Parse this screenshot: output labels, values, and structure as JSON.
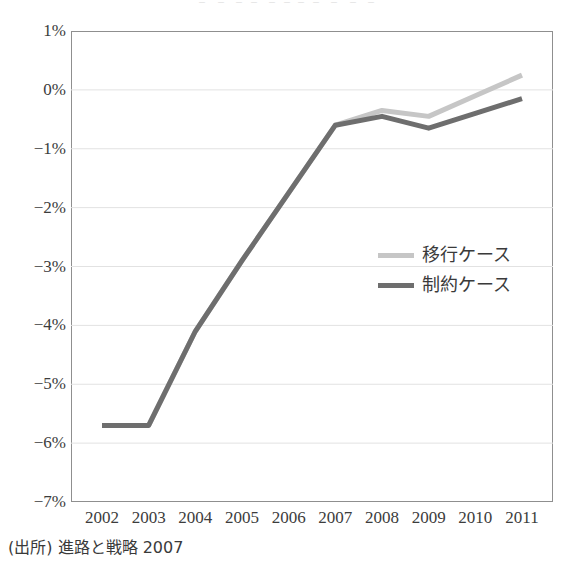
{
  "clipped_heading": "゠  ゠  ゠゠  ゠゠゠゠  ゠  ゠  ゠",
  "source_note": "(出所) 進路と戦略 2007",
  "legend": {
    "position": "inside-right",
    "entries": [
      {
        "label": "移行ケース",
        "color": "#c6c6c6"
      },
      {
        "label": "制約ケース",
        "color": "#6e6e6e"
      }
    ]
  },
  "axis": {
    "y_ticks": [
      "1%",
      "0%",
      "−1%",
      "−2%",
      "−3%",
      "−4%",
      "−5%",
      "−6%",
      "−7%"
    ],
    "x_ticks": [
      "2002",
      "2003",
      "2004",
      "2005",
      "2006",
      "2007",
      "2008",
      "2009",
      "2010",
      "2011"
    ]
  },
  "chart_data": {
    "type": "line",
    "title": "",
    "xlabel": "",
    "ylabel": "",
    "x": [
      2002,
      2003,
      2004,
      2005,
      2006,
      2007,
      2008,
      2009,
      2010,
      2011
    ],
    "categories": [
      "2002",
      "2003",
      "2004",
      "2005",
      "2006",
      "2007",
      "2008",
      "2009",
      "2010",
      "2011"
    ],
    "series": [
      {
        "name": "移行ケース",
        "color": "#c6c6c6",
        "values": [
          -5.7,
          -5.7,
          -4.1,
          -2.9,
          -1.75,
          -0.6,
          -0.35,
          -0.45,
          -0.1,
          0.25
        ]
      },
      {
        "name": "制約ケース",
        "color": "#6e6e6e",
        "values": [
          -5.7,
          -5.7,
          -4.1,
          -2.9,
          -1.75,
          -0.6,
          -0.45,
          -0.65,
          -0.4,
          -0.15
        ]
      }
    ],
    "ylim": [
      -7,
      1
    ],
    "xlim": [
      2002,
      2011
    ],
    "ytick_values": [
      1,
      0,
      -1,
      -2,
      -3,
      -4,
      -5,
      -6,
      -7
    ],
    "yunit": "percent",
    "grid": "horizontal",
    "legend_position": "inside-right"
  }
}
